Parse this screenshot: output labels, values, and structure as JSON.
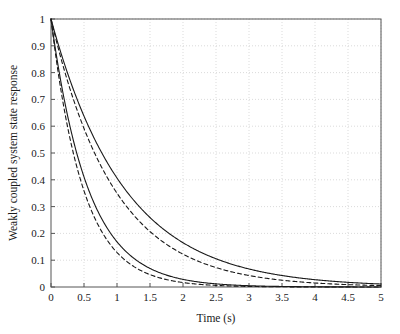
{
  "chart_data": {
    "type": "line",
    "title": "",
    "xlabel": "Time (s)",
    "ylabel": "Weakly coupled system state response",
    "xlim": [
      0,
      5
    ],
    "ylim": [
      0,
      1
    ],
    "grid": true,
    "legend": "none",
    "xticks": [
      "0",
      "0.5",
      "1",
      "1.5",
      "2",
      "2.5",
      "3",
      "3.5",
      "4",
      "4.5",
      "5"
    ],
    "xtick_values": [
      0,
      0.5,
      1,
      1.5,
      2,
      2.5,
      3,
      3.5,
      4,
      4.5,
      5
    ],
    "yticks": [
      "0",
      "0.1",
      "0.2",
      "0.3",
      "0.4",
      "0.5",
      "0.6",
      "0.7",
      "0.8",
      "0.9",
      "1"
    ],
    "ytick_values": [
      0,
      0.1,
      0.2,
      0.3,
      0.4,
      0.5,
      0.6,
      0.7,
      0.8,
      0.9,
      1
    ],
    "x": [
      0,
      0.1,
      0.2,
      0.3,
      0.4,
      0.5,
      0.6,
      0.7,
      0.8,
      0.9,
      1,
      1.2,
      1.4,
      1.6,
      1.8,
      2,
      2.25,
      2.5,
      2.75,
      3,
      3.25,
      3.5,
      3.75,
      4,
      4.25,
      4.5,
      4.75,
      5
    ],
    "series": [
      {
        "name": "slow-solid",
        "style": "solid",
        "color": "#1a1a1a",
        "decay_rate": 0.9,
        "values": [
          1,
          0.914,
          0.835,
          0.763,
          0.698,
          0.638,
          0.583,
          0.533,
          0.487,
          0.445,
          0.407,
          0.339,
          0.284,
          0.237,
          0.198,
          0.165,
          0.133,
          0.105,
          0.084,
          0.067,
          0.054,
          0.043,
          0.034,
          0.027,
          0.022,
          0.017,
          0.014,
          0.011
        ]
      },
      {
        "name": "slow-dashed",
        "style": "dashed",
        "color": "#1a1a1a",
        "decay_rate": 1.05,
        "values": [
          1,
          0.9,
          0.811,
          0.73,
          0.657,
          0.592,
          0.533,
          0.48,
          0.432,
          0.389,
          0.35,
          0.284,
          0.23,
          0.186,
          0.151,
          0.122,
          0.094,
          0.072,
          0.056,
          0.043,
          0.033,
          0.025,
          0.019,
          0.015,
          0.011,
          0.009,
          0.007,
          0.005
        ]
      },
      {
        "name": "fast-solid",
        "style": "solid",
        "color": "#1a1a1a",
        "decay_rate": 1.78,
        "values": [
          1,
          0.837,
          0.701,
          0.587,
          0.491,
          0.411,
          0.344,
          0.288,
          0.241,
          0.202,
          0.169,
          0.118,
          0.083,
          0.058,
          0.041,
          0.028,
          0.018,
          0.012,
          0.008,
          0.005,
          0.003,
          0.002,
          0.001,
          0.001,
          0.001,
          0.0,
          0.0,
          0.0
        ]
      },
      {
        "name": "fast-dashed",
        "style": "dashed",
        "color": "#1a1a1a",
        "decay_rate": 2.05,
        "values": [
          1,
          0.815,
          0.664,
          0.541,
          0.441,
          0.359,
          0.292,
          0.238,
          0.194,
          0.158,
          0.129,
          0.086,
          0.057,
          0.038,
          0.025,
          0.017,
          0.01,
          0.006,
          0.004,
          0.002,
          0.001,
          0.001,
          0.0,
          0.0,
          0.0,
          0.0,
          0.0,
          0.0
        ]
      }
    ]
  },
  "figure": {
    "background_color": "#ffffff",
    "axis_color": "#555555",
    "grid_color": "#cccccc",
    "line_color": "#1a1a1a"
  }
}
